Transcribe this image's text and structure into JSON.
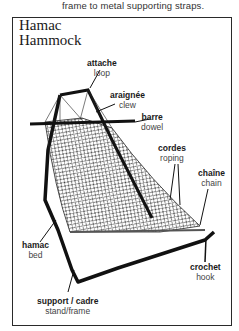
{
  "caption": "frame to metal supporting straps.",
  "title": {
    "line1": "Hamac",
    "line2": "Hammock"
  },
  "labels": [
    {
      "fr": "attache",
      "en": "loop"
    },
    {
      "fr": "araignée",
      "en": "clew"
    },
    {
      "fr": "barre",
      "en": "dowel"
    },
    {
      "fr": "cordes",
      "en": "roping"
    },
    {
      "fr": "chaîne",
      "en": "chain"
    },
    {
      "fr": "hamac",
      "en": "bed"
    },
    {
      "fr": "crochet",
      "en": "hook"
    },
    {
      "fr": "support / cadre",
      "en": "stand/frame"
    }
  ]
}
